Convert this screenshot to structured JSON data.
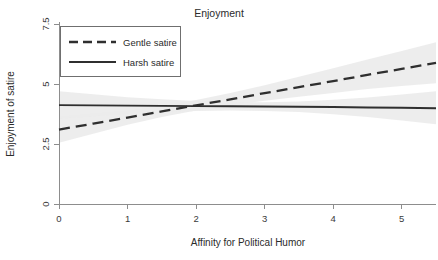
{
  "chart_data": {
    "type": "line",
    "title": "Enjoyment",
    "xlabel": "Affinity for Political Humor",
    "ylabel": "Enjoyment of satire",
    "xlim": [
      0,
      5.5
    ],
    "ylim": [
      0,
      7.5
    ],
    "xticks": [
      0,
      1,
      2,
      3,
      4,
      5
    ],
    "xtick_labels": [
      "0",
      "1",
      "2",
      "3",
      "4",
      "5"
    ],
    "yticks": [
      0,
      2.5,
      5,
      7.5
    ],
    "ytick_labels": [
      "0",
      "2.5",
      "5",
      "7.5"
    ],
    "grid": false,
    "legend_position": "top-left",
    "x": [
      0,
      0.5,
      1,
      1.5,
      2,
      2.5,
      3,
      3.5,
      4,
      4.5,
      5,
      5.5
    ],
    "series": [
      {
        "name": "Gentle satire",
        "style": "dashed",
        "color": "#2f2f2f",
        "values": [
          3.1,
          3.35,
          3.6,
          3.86,
          4.11,
          4.36,
          4.62,
          4.87,
          5.12,
          5.38,
          5.63,
          5.88
        ],
        "ci_lower": [
          2.55,
          2.93,
          3.3,
          3.63,
          3.9,
          4.11,
          4.3,
          4.47,
          4.63,
          4.79,
          4.92,
          5.03
        ],
        "ci_upper": [
          3.65,
          3.78,
          3.9,
          4.09,
          4.33,
          4.62,
          4.95,
          5.3,
          5.66,
          6.02,
          6.38,
          6.74
        ]
      },
      {
        "name": "Harsh satire",
        "style": "solid",
        "color": "#2f2f2f",
        "values": [
          4.12,
          4.11,
          4.1,
          4.09,
          4.08,
          4.07,
          4.06,
          4.05,
          4.04,
          4.02,
          4.01,
          3.99
        ],
        "ci_lower": [
          3.55,
          3.66,
          3.76,
          3.83,
          3.88,
          3.9,
          3.88,
          3.83,
          3.74,
          3.62,
          3.48,
          3.32
        ],
        "ci_upper": [
          4.7,
          4.57,
          4.45,
          4.36,
          4.29,
          4.25,
          4.24,
          4.27,
          4.34,
          4.44,
          4.56,
          4.7
        ]
      }
    ],
    "annotations": [],
    "band_color": "#ebebeb",
    "crossing_point": {
      "x": 1.9,
      "y": 4.05
    }
  },
  "legend": {
    "entries": [
      {
        "label": "Gentle satire",
        "style": "dashed"
      },
      {
        "label": "Harsh satire",
        "style": "solid"
      }
    ]
  }
}
